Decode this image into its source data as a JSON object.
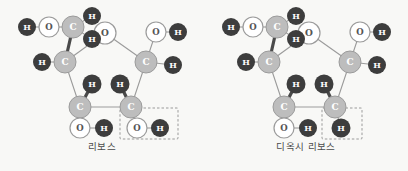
{
  "figure": {
    "background_color": "#f8f8f6",
    "panels": [
      {
        "id": "ribose",
        "caption": "리보스",
        "highlight_group": "OH",
        "highlight_box": {
          "style": "dashed",
          "color": "#9a9a9a"
        },
        "atoms": [
          {
            "name": "ring-oxygen",
            "element": "O",
            "x": 105,
            "y": 33
          },
          {
            "name": "c4-prime",
            "element": "C",
            "x": 65,
            "y": 62
          },
          {
            "name": "c1-prime",
            "element": "C",
            "x": 146,
            "y": 62
          },
          {
            "name": "c3-prime",
            "element": "C",
            "x": 80,
            "y": 107
          },
          {
            "name": "c2-prime",
            "element": "C",
            "x": 131,
            "y": 107
          },
          {
            "name": "c5-prime",
            "element": "C",
            "x": 73,
            "y": 27
          },
          {
            "name": "c5-hydrogen-up",
            "element": "H",
            "x": 92,
            "y": 16
          },
          {
            "name": "c5-hydrogen-down",
            "element": "H",
            "x": 92,
            "y": 39
          },
          {
            "name": "c5-oxygen",
            "element": "O",
            "x": 49,
            "y": 27
          },
          {
            "name": "c5-hydroxyl-h",
            "element": "H",
            "x": 27,
            "y": 27
          },
          {
            "name": "c4-hydrogen",
            "element": "H",
            "x": 42,
            "y": 62
          },
          {
            "name": "c1-oxygen",
            "element": "O",
            "x": 156,
            "y": 32
          },
          {
            "name": "c1-hydroxyl-h",
            "element": "H",
            "x": 178,
            "y": 32
          },
          {
            "name": "c1-hydrogen",
            "element": "H",
            "x": 173,
            "y": 65
          },
          {
            "name": "c3-hydrogen",
            "element": "H",
            "x": 92,
            "y": 84
          },
          {
            "name": "c3-oxygen",
            "element": "O",
            "x": 80,
            "y": 128
          },
          {
            "name": "c3-hydroxyl-h",
            "element": "H",
            "x": 104,
            "y": 128
          },
          {
            "name": "c2-hydrogen",
            "element": "H",
            "x": 120,
            "y": 84
          },
          {
            "name": "c2-oxygen-boxed",
            "element": "O",
            "x": 137,
            "y": 128
          },
          {
            "name": "c2-hydroxyl-h-boxed",
            "element": "H",
            "x": 160,
            "y": 128
          }
        ]
      },
      {
        "id": "deoxyribose",
        "caption": "디옥시 리보스",
        "highlight_group": "H",
        "highlight_box": {
          "style": "dashed",
          "color": "#9a9a9a"
        },
        "atoms": [
          {
            "name": "ring-oxygen",
            "element": "O",
            "x": 105,
            "y": 33
          },
          {
            "name": "c4-prime",
            "element": "C",
            "x": 65,
            "y": 62
          },
          {
            "name": "c1-prime",
            "element": "C",
            "x": 146,
            "y": 62
          },
          {
            "name": "c3-prime",
            "element": "C",
            "x": 80,
            "y": 107
          },
          {
            "name": "c2-prime",
            "element": "C",
            "x": 131,
            "y": 107
          },
          {
            "name": "c5-prime",
            "element": "C",
            "x": 73,
            "y": 27
          },
          {
            "name": "c5-hydrogen-up",
            "element": "H",
            "x": 92,
            "y": 16
          },
          {
            "name": "c5-hydrogen-down",
            "element": "H",
            "x": 92,
            "y": 39
          },
          {
            "name": "c5-oxygen",
            "element": "O",
            "x": 49,
            "y": 27
          },
          {
            "name": "c5-hydroxyl-h",
            "element": "H",
            "x": 27,
            "y": 27
          },
          {
            "name": "c4-hydrogen",
            "element": "H",
            "x": 42,
            "y": 62
          },
          {
            "name": "c1-oxygen",
            "element": "O",
            "x": 156,
            "y": 32
          },
          {
            "name": "c1-hydroxyl-h",
            "element": "H",
            "x": 178,
            "y": 32
          },
          {
            "name": "c1-hydrogen",
            "element": "H",
            "x": 173,
            "y": 65
          },
          {
            "name": "c3-hydrogen",
            "element": "H",
            "x": 92,
            "y": 84
          },
          {
            "name": "c3-oxygen",
            "element": "O",
            "x": 80,
            "y": 128
          },
          {
            "name": "c3-hydroxyl-h",
            "element": "H",
            "x": 104,
            "y": 128
          },
          {
            "name": "c2-hydrogen",
            "element": "H",
            "x": 120,
            "y": 84
          },
          {
            "name": "c2-hydrogen-boxed",
            "element": "H",
            "x": 137,
            "y": 128
          }
        ]
      }
    ],
    "colors": {
      "hydrogen_fill": "#3d3d3d",
      "hydrogen_text": "#ffffff",
      "oxygen_fill": "#ffffff",
      "oxygen_stroke": "#9b9b9b",
      "oxygen_text": "#555555",
      "carbon_fill": "#bdbdbd",
      "carbon_stroke": "#9b9b9b",
      "carbon_text": "#ffffff",
      "bond_thin": "#9b9b9b",
      "bond_thick": "#4a4a4a",
      "dash_box": "#9a9a9a",
      "caption_text": "#4a4a4a"
    },
    "labels": {
      "hydrogen": "H",
      "oxygen": "O",
      "carbon": "C"
    }
  }
}
